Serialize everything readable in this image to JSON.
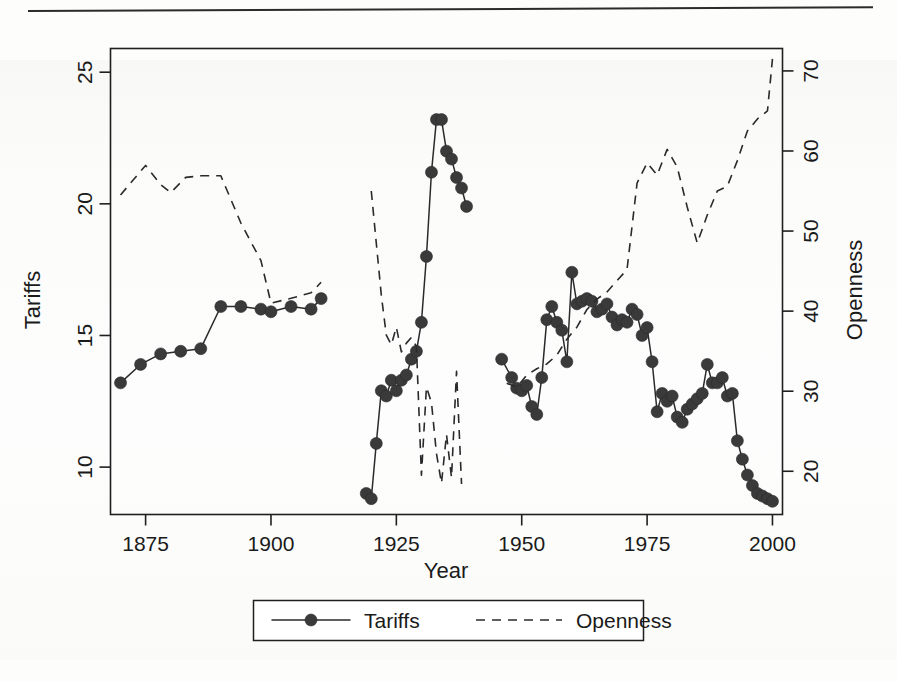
{
  "figure": {
    "background_color": "#fdfdfc",
    "ink_color": "#2a2a2a"
  },
  "chart_data": {
    "type": "line",
    "title": "",
    "xlabel": "Year",
    "ylabel": "Tariffs",
    "y2label": "Openness",
    "xlim": [
      1868,
      2002
    ],
    "ylim": [
      8.2,
      25.9
    ],
    "y2lim": [
      14.6,
      72.8
    ],
    "grid": false,
    "legend_position": "bottom-outside",
    "xticks": [
      1875,
      1900,
      1925,
      1950,
      1975,
      2000
    ],
    "xticklabels": [
      "1875",
      "1900",
      "1925",
      "1950",
      "1975",
      "2000"
    ],
    "yticks": [
      10,
      15,
      20,
      25
    ],
    "yticklabels": [
      "10",
      "15",
      "20",
      "25"
    ],
    "y2ticks": [
      20,
      30,
      40,
      50,
      60,
      70
    ],
    "y2ticklabels": [
      "20",
      "30",
      "40",
      "50",
      "60",
      "70"
    ],
    "series": [
      {
        "name": "Tariffs",
        "axis": "left",
        "style": "solid",
        "marker": "filled-circle",
        "segments": [
          {
            "label": "pre-war",
            "x": [
              1870,
              1874,
              1878,
              1882,
              1886,
              1890,
              1894,
              1898,
              1900,
              1904,
              1908,
              1910
            ],
            "y": [
              13.2,
              13.9,
              14.3,
              14.4,
              14.5,
              16.1,
              16.1,
              16.0,
              15.9,
              16.1,
              16.0,
              16.4
            ]
          },
          {
            "label": "interwar",
            "x": [
              1919,
              1920,
              1921,
              1922,
              1923,
              1924,
              1925,
              1926,
              1927,
              1928,
              1929,
              1930,
              1931,
              1932,
              1933,
              1934,
              1935,
              1936,
              1937,
              1938,
              1939
            ],
            "y": [
              9.0,
              8.8,
              10.9,
              12.9,
              12.7,
              13.3,
              12.9,
              13.3,
              13.5,
              14.1,
              14.4,
              15.5,
              18.0,
              21.2,
              23.2,
              23.2,
              22.0,
              21.7,
              21.0,
              20.6,
              19.9,
              19.9
            ]
          },
          {
            "label": "postwar",
            "x": [
              1946,
              1948,
              1949,
              1950,
              1951,
              1952,
              1953,
              1954,
              1955,
              1956,
              1957,
              1958,
              1959,
              1960,
              1961,
              1962,
              1963,
              1964,
              1965,
              1966,
              1967,
              1968,
              1969,
              1970,
              1971,
              1972,
              1973,
              1974,
              1975,
              1976,
              1977,
              1978,
              1979,
              1980,
              1981,
              1982,
              1983,
              1984,
              1985,
              1986,
              1987,
              1988,
              1989,
              1990,
              1991,
              1992,
              1993,
              1994,
              1995,
              1996,
              1997,
              1998,
              1999,
              2000
            ],
            "y": [
              14.1,
              13.4,
              13.0,
              12.9,
              13.1,
              12.3,
              12.0,
              13.4,
              15.6,
              16.1,
              15.5,
              15.2,
              14.0,
              17.4,
              16.2,
              16.3,
              16.4,
              16.3,
              15.9,
              16.0,
              16.2,
              15.7,
              15.4,
              15.6,
              15.5,
              16.0,
              15.8,
              15.0,
              15.3,
              14.0,
              12.1,
              12.8,
              12.5,
              12.7,
              11.9,
              11.7,
              12.2,
              12.4,
              12.6,
              12.8,
              13.9,
              13.2,
              13.2,
              13.4,
              12.7,
              12.8,
              11.0,
              10.3,
              9.7,
              9.3,
              9.0,
              8.9,
              8.8,
              8.7
            ]
          }
        ]
      },
      {
        "name": "Openness",
        "axis": "right",
        "style": "dashed",
        "marker": "none",
        "segments": [
          {
            "label": "pre-war",
            "x": [
              1870,
              1872,
              1875,
              1878,
              1880,
              1883,
              1886,
              1890,
              1894,
              1898,
              1900,
              1904,
              1908,
              1910
            ],
            "y": [
              54.5,
              56.0,
              58.2,
              55.8,
              54.8,
              56.7,
              56.9,
              56.9,
              51.0,
              46.3,
              41.0,
              41.6,
              42.3,
              43.6
            ]
          },
          {
            "label": "interwar",
            "x": [
              1920,
              1921,
              1922,
              1923,
              1924,
              1925,
              1926,
              1927,
              1928,
              1929,
              1930,
              1931,
              1932,
              1933,
              1934,
              1935,
              1936,
              1937,
              1938
            ],
            "y": [
              55.0,
              48.5,
              42.0,
              37.0,
              35.8,
              38.0,
              34.9,
              36.0,
              36.7,
              35.6,
              19.5,
              30.5,
              28.6,
              22.2,
              18.5,
              24.6,
              19.2,
              32.5,
              18.4,
              31.0,
              18.8
            ]
          },
          {
            "label": "postwar",
            "x": [
              1947,
              1949,
              1951,
              1953,
              1955,
              1957,
              1959,
              1961,
              1963,
              1965,
              1967,
              1969,
              1971,
              1973,
              1975,
              1977,
              1979,
              1981,
              1983,
              1985,
              1987,
              1989,
              1991,
              1993,
              1995,
              1997,
              1999,
              2000
            ],
            "y": [
              31.0,
              30.5,
              32.0,
              32.8,
              33.4,
              34.5,
              36.5,
              38.0,
              40.2,
              41.5,
              42.4,
              43.8,
              45.2,
              56.0,
              58.5,
              57.0,
              60.2,
              58.0,
              53.0,
              48.5,
              52.0,
              55.0,
              55.6,
              58.8,
              62.5,
              64.0,
              65.0,
              71.5
            ]
          }
        ]
      }
    ],
    "legend": [
      {
        "label": "Tariffs",
        "style": "solid-with-marker"
      },
      {
        "label": "Openness",
        "style": "dashed"
      }
    ]
  }
}
